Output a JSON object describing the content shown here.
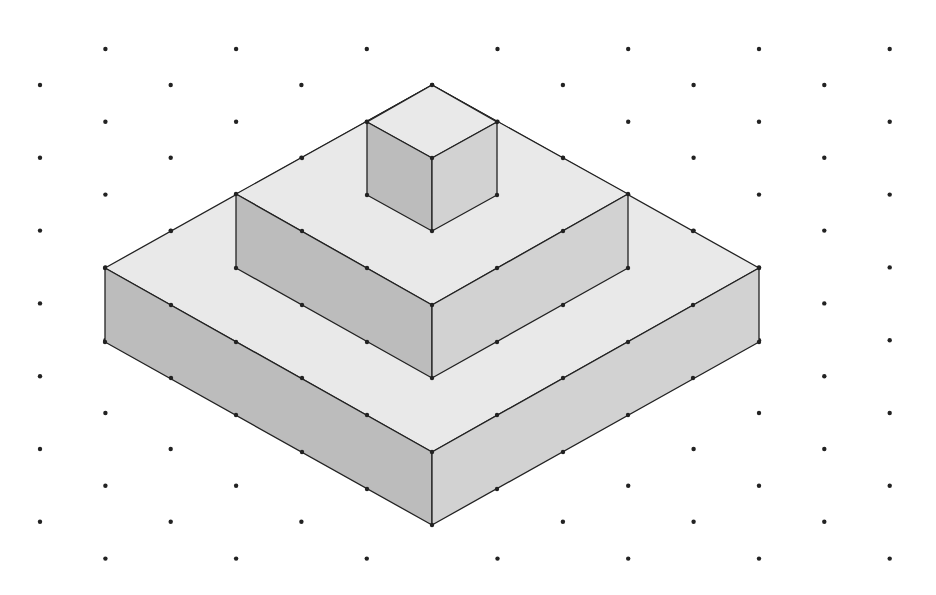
{
  "diagram": {
    "title": "",
    "type": "isometric-dot-grid-stepped-pyramid",
    "colors": {
      "background": "#ffffff",
      "dot": "#222222",
      "edge": "#222222",
      "top_face": "#e9e9e9",
      "left_face": "#bcbcbc",
      "right_face": "#d2d2d2"
    },
    "grid": {
      "x0": 40,
      "dx": 65.36,
      "columns": 14,
      "y_even_start": 85,
      "y_odd_start": 49,
      "dy": 72.8,
      "y_max": 565,
      "dot_radius": 2.2
    },
    "solids": [
      {
        "name": "bottom-slab",
        "top": [
          [
            105,
            268
          ],
          [
            432,
            85
          ],
          [
            759,
            268
          ],
          [
            432,
            452
          ]
        ],
        "left": [
          [
            105,
            268
          ],
          [
            432,
            452
          ],
          [
            432,
            525
          ],
          [
            105,
            342
          ]
        ],
        "right": [
          [
            432,
            452
          ],
          [
            759,
            268
          ],
          [
            759,
            342
          ],
          [
            432,
            525
          ]
        ]
      },
      {
        "name": "middle-slab",
        "top": [
          [
            236,
            194
          ],
          [
            432,
            85
          ],
          [
            628,
            194
          ],
          [
            432,
            305
          ]
        ],
        "left": [
          [
            236,
            194
          ],
          [
            432,
            305
          ],
          [
            432,
            378
          ],
          [
            236,
            268
          ]
        ],
        "right": [
          [
            432,
            305
          ],
          [
            628,
            194
          ],
          [
            628,
            268
          ],
          [
            432,
            378
          ]
        ]
      },
      {
        "name": "top-cube",
        "top": [
          [
            367,
            122
          ],
          [
            432,
            85
          ],
          [
            497,
            122
          ],
          [
            432,
            158
          ]
        ],
        "left": [
          [
            367,
            122
          ],
          [
            432,
            158
          ],
          [
            432,
            231
          ],
          [
            367,
            195
          ]
        ],
        "right": [
          [
            432,
            158
          ],
          [
            497,
            122
          ],
          [
            497,
            195
          ],
          [
            432,
            231
          ]
        ]
      }
    ],
    "edge_dots": [
      [
        105,
        268
      ],
      [
        105,
        342
      ],
      [
        171,
        231
      ],
      [
        236,
        194
      ],
      [
        302,
        158
      ],
      [
        367,
        122
      ],
      [
        432,
        85
      ],
      [
        497,
        122
      ],
      [
        563,
        158
      ],
      [
        628,
        194
      ],
      [
        693,
        231
      ],
      [
        759,
        268
      ],
      [
        759,
        342
      ],
      [
        171,
        305
      ],
      [
        236,
        342
      ],
      [
        302,
        378
      ],
      [
        367,
        415
      ],
      [
        432,
        452
      ],
      [
        497,
        415
      ],
      [
        563,
        378
      ],
      [
        628,
        342
      ],
      [
        693,
        305
      ],
      [
        171,
        378
      ],
      [
        236,
        415
      ],
      [
        302,
        452
      ],
      [
        367,
        489
      ],
      [
        432,
        525
      ],
      [
        497,
        489
      ],
      [
        563,
        452
      ],
      [
        628,
        415
      ],
      [
        693,
        378
      ],
      [
        236,
        268
      ],
      [
        302,
        305
      ],
      [
        367,
        342
      ],
      [
        432,
        378
      ],
      [
        497,
        342
      ],
      [
        563,
        305
      ],
      [
        628,
        268
      ],
      [
        302,
        231
      ],
      [
        367,
        268
      ],
      [
        432,
        305
      ],
      [
        497,
        268
      ],
      [
        563,
        231
      ],
      [
        367,
        195
      ],
      [
        432,
        158
      ],
      [
        432,
        231
      ],
      [
        497,
        195
      ]
    ]
  }
}
